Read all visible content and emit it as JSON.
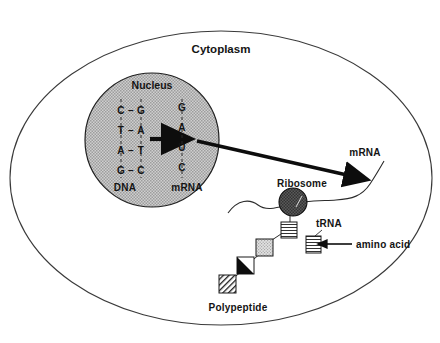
{
  "diagram": {
    "labels": {
      "cytoplasm": "Cytoplasm",
      "nucleus": "Nucleus",
      "dna": "DNA",
      "mrna_nucleus": "mRNA",
      "mrna_cytoplasm": "mRNA",
      "ribosome": "Ribosome",
      "trna": "tRNA",
      "amino_acid": "amino acid",
      "polypeptide": "Polypeptide"
    },
    "dna_base_pairs": [
      {
        "left": "C",
        "bond": "–",
        "right": "G"
      },
      {
        "left": "T",
        "bond": "–",
        "right": "A"
      },
      {
        "left": "A",
        "bond": "–",
        "right": "T"
      },
      {
        "left": "G",
        "bond": "–",
        "right": "C"
      }
    ],
    "mrna_bases": [
      "G",
      "A",
      "U",
      "C"
    ],
    "polypeptide_units": [
      {
        "id": "unit-striped-horizontal",
        "fill": "horizontal-stripes"
      },
      {
        "id": "unit-stippled",
        "fill": "stippled-gray"
      },
      {
        "id": "unit-black-wedge",
        "fill": "black-wedge"
      },
      {
        "id": "unit-diagonal-hatch",
        "fill": "diagonal-hatch"
      }
    ],
    "colors": {
      "outline": "#141414",
      "nucleus_fill": "#b7b7b7",
      "ribosome_fill": "#4a4a4a",
      "cell_membrane": "#3a3a3a",
      "background": "#ffffff",
      "strand": "#2b2b2b"
    }
  }
}
